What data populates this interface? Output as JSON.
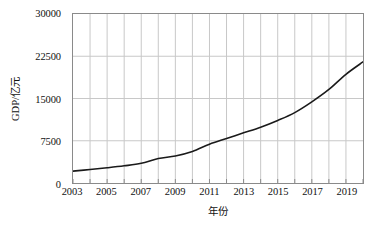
{
  "chart_data": {
    "type": "line",
    "title": "",
    "xlabel": "年份",
    "ylabel": "GDP/亿元",
    "xlim": [
      2003,
      2020
    ],
    "ylim": [
      0,
      30000
    ],
    "grid": true,
    "legend": "none",
    "line_color": "#1a1a1a",
    "grid_color": "#c8c8c8",
    "axis_color": "#8a8a8a",
    "x_tick_labels": [
      "2003",
      "2005",
      "2007",
      "2009",
      "2011",
      "2013",
      "2015",
      "2017",
      "2019"
    ],
    "x_tick_values": [
      2003,
      2005,
      2007,
      2009,
      2011,
      2013,
      2015,
      2017,
      2019
    ],
    "x_minor_ticks": [
      2004,
      2006,
      2008,
      2010,
      2012,
      2014,
      2016,
      2018,
      2020
    ],
    "y_tick_labels": [
      "0",
      "7500",
      "15000",
      "22500",
      "30000"
    ],
    "y_tick_values": [
      0,
      7500,
      15000,
      22500,
      30000
    ],
    "x": [
      2003,
      2004,
      2005,
      2006,
      2007,
      2008,
      2009,
      2010,
      2011,
      2012,
      2013,
      2014,
      2015,
      2016,
      2017,
      2018,
      2019,
      2020
    ],
    "values": [
      2100,
      2400,
      2700,
      3050,
      3500,
      4350,
      4800,
      5600,
      6900,
      7900,
      8900,
      9900,
      11100,
      12500,
      14400,
      16600,
      19300,
      21500
    ],
    "series": [
      {
        "name": "GDP",
        "values": [
          2100,
          2400,
          2700,
          3050,
          3500,
          4350,
          4800,
          5600,
          6900,
          7900,
          8900,
          9900,
          11100,
          12500,
          14400,
          16600,
          19300,
          21500
        ]
      }
    ]
  }
}
